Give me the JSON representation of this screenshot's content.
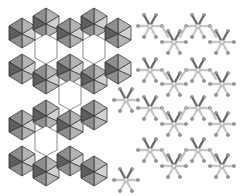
{
  "figure": {
    "left_panel": {
      "style": "polyhedral",
      "rings": "hexagonal channels"
    },
    "right_panel": {
      "style": "ball-and-stick",
      "rings": "hexagonal channels"
    },
    "colors": {
      "background": "#ffffff",
      "polyhedron_light": "#b4b4b4",
      "polyhedron_dark": "#5e5e5e",
      "bond_light": "#c8c8c8",
      "bond_dark": "#6a6a6a"
    }
  }
}
